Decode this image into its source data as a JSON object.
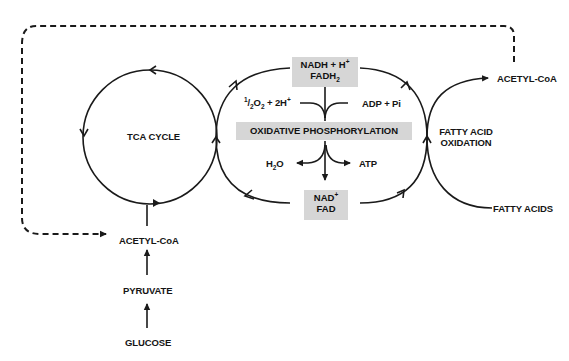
{
  "diagram": {
    "type": "metabolic-pathway",
    "nodes": {
      "tca_cycle": "TCA CYCLE",
      "oxidative_phosphorylation": "OXIDATIVE PHOSPHORYLATION",
      "fatty_acid_oxidation_line1": "FATTY ACID",
      "fatty_acid_oxidation_line2": "OXIDATION",
      "acetyl_coa_top": "ACETYL-CoA",
      "acetyl_coa_bottom": "ACETYL-CoA",
      "fatty_acids": "FATTY ACIDS",
      "pyruvate": "PYRUVATE",
      "glucose": "GLUCOSE"
    },
    "reduced_carriers": {
      "line1_main": "NADH + H",
      "line1_sup": "+",
      "line2_main": "FADH",
      "line2_sub": "2"
    },
    "oxidized_carriers": {
      "line1_main": "NAD",
      "line1_sup": "+",
      "line2_main": "FAD"
    },
    "inputs": {
      "oxygen_sup": "1",
      "oxygen_mid": "/",
      "oxygen_sub1": "2",
      "oxygen_o": "O",
      "oxygen_sub2": "2",
      "oxygen_rest": " + 2H",
      "oxygen_sup2": "+",
      "adp": "ADP + Pi"
    },
    "outputs": {
      "water_h": "H",
      "water_sub": "2",
      "water_o": "O",
      "atp": "ATP"
    },
    "edges": [
      {
        "from": "GLUCOSE",
        "to": "PYRUVATE",
        "style": "solid"
      },
      {
        "from": "PYRUVATE",
        "to": "ACETYL-CoA",
        "style": "solid"
      },
      {
        "from": "ACETYL-CoA",
        "to": "TCA CYCLE",
        "style": "solid"
      },
      {
        "from": "TCA CYCLE",
        "to": "NADH + H+ / FADH2",
        "style": "solid"
      },
      {
        "from": "NAD+ / FAD",
        "to": "TCA CYCLE",
        "style": "solid"
      },
      {
        "from": "FATTY ACID OXIDATION",
        "to": "NADH + H+ / FADH2",
        "style": "solid"
      },
      {
        "from": "NAD+ / FAD",
        "to": "FATTY ACID OXIDATION",
        "style": "solid"
      },
      {
        "from": "FATTY ACIDS",
        "to": "ACETYL-CoA (top)",
        "style": "solid"
      },
      {
        "from": "ACETYL-CoA (top)",
        "to": "ACETYL-CoA (bottom)",
        "style": "dashed"
      },
      {
        "from": "1/2O2 + 2H+ , ADP + Pi",
        "to": "OXIDATIVE PHOSPHORYLATION",
        "style": "solid"
      },
      {
        "from": "OXIDATIVE PHOSPHORYLATION",
        "to": "H2O, ATP, NAD+ / FAD",
        "style": "solid"
      }
    ]
  },
  "colors": {
    "line": "#1a1a1a",
    "box_fill": "#d6d6d6",
    "background": "#ffffff"
  }
}
